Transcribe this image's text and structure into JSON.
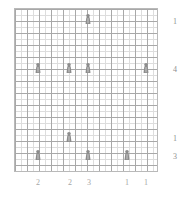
{
  "puzzle": {
    "title": "grid-token-puzzle",
    "grid": {
      "major_columns": 12,
      "major_rows": 13,
      "minor_per_major": 2,
      "line_color_major": "#a8a8a8",
      "line_color_minor": "#dddddd",
      "border_color": "#b9b9b9",
      "background": "#ffffff",
      "left": 14,
      "top": 8,
      "width": 144,
      "height": 164
    },
    "token": {
      "icon_name": "pawn-token-icon",
      "color": "#8c8c8c",
      "count": 8
    },
    "tokens": [
      {
        "id": "token-1",
        "x": 88,
        "y": 19
      },
      {
        "id": "token-2",
        "x": 38,
        "y": 68
      },
      {
        "id": "token-3",
        "x": 69,
        "y": 68
      },
      {
        "id": "token-4",
        "x": 88,
        "y": 68
      },
      {
        "id": "token-5",
        "x": 146,
        "y": 68
      },
      {
        "id": "token-6",
        "x": 69,
        "y": 137
      },
      {
        "id": "token-7",
        "x": 38,
        "y": 155
      },
      {
        "id": "token-8",
        "x": 88,
        "y": 155
      },
      {
        "id": "token-9",
        "x": 127,
        "y": 155
      }
    ],
    "row_clues": [
      {
        "label": "1",
        "x": 175,
        "y": 21
      },
      {
        "label": "4",
        "x": 175,
        "y": 69
      },
      {
        "label": "1",
        "x": 175,
        "y": 138
      },
      {
        "label": "3",
        "x": 175,
        "y": 156
      }
    ],
    "column_clues": [
      {
        "label": "2",
        "x": 38,
        "y": 182
      },
      {
        "label": "2",
        "x": 70,
        "y": 182
      },
      {
        "label": "3",
        "x": 89,
        "y": 182
      },
      {
        "label": "1",
        "x": 127,
        "y": 182
      },
      {
        "label": "1",
        "x": 146,
        "y": 182
      }
    ]
  },
  "chart_data": {
    "type": "heatmap",
    "title": "",
    "xlabel": "",
    "ylabel": "",
    "grid": true,
    "legend": "none",
    "categories": [
      "col-1",
      "col-2",
      "col-3",
      "col-4",
      "col-5"
    ],
    "column_clue_values": [
      2,
      2,
      3,
      1,
      1
    ],
    "row_clue_values": [
      1,
      4,
      1,
      3
    ],
    "marker_positions": [
      [
        88,
        19
      ],
      [
        38,
        68
      ],
      [
        69,
        68
      ],
      [
        88,
        68
      ],
      [
        146,
        68
      ],
      [
        69,
        137
      ],
      [
        38,
        155
      ],
      [
        88,
        155
      ],
      [
        127,
        155
      ]
    ]
  }
}
